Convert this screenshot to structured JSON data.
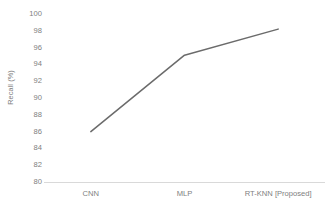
{
  "chart_data": {
    "type": "line",
    "title": "",
    "subtitle": "",
    "xlabel": "",
    "ylabel": "Recall (%)",
    "categories": [
      "CNN",
      "MLP",
      "RT-KNN [Proposed]"
    ],
    "values": [
      86.0,
      95.1,
      98.2
    ],
    "series": [
      {
        "name": "Recall",
        "values": [
          86.0,
          95.1,
          98.2
        ],
        "color": "#6b6b6b",
        "line_width": 1.5,
        "markers": false
      }
    ],
    "ylim": [
      80,
      100
    ],
    "ytick_step": 2,
    "ytick_labels": [
      "100",
      "98",
      "96",
      "94",
      "92",
      "90",
      "88",
      "86",
      "84",
      "82",
      "80"
    ],
    "ytick_values": [
      100,
      98,
      96,
      94,
      92,
      90,
      88,
      86,
      84,
      82,
      80
    ],
    "grid": false,
    "legend": false,
    "legend_position": "none",
    "axis_line_color": "#d9d9d9",
    "tick_label_color": "#808080",
    "background_color": "#ffffff"
  }
}
